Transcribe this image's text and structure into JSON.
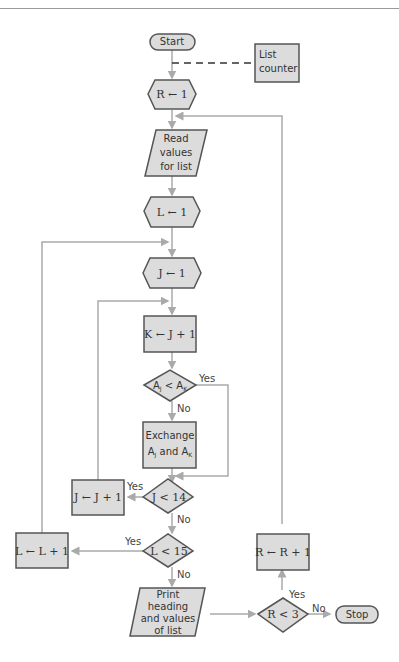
{
  "header": {
    "running_title": ""
  },
  "colors": {
    "shape_fill": "#dcdcdc",
    "shape_stroke": "#555555",
    "line": "#aaaaaa",
    "background": "#ffffff"
  },
  "flowchart": {
    "start": "Start",
    "annotation": [
      "List",
      "counter"
    ],
    "r_init": "R ← 1",
    "read": [
      "Read",
      "values",
      "for list"
    ],
    "l_init": "L ← 1",
    "j_init": "J ← 1",
    "k_assign": "K ← J + 1",
    "compare": {
      "left": "A",
      "left_sub": "J",
      "op": " < ",
      "right": "A",
      "right_sub": "K"
    },
    "exchange": {
      "line1": "Exchange",
      "line2_a": "A",
      "line2_a_sub": "J",
      "line2_mid": " and ",
      "line2_b": "A",
      "line2_b_sub": "K"
    },
    "j_test": "J < 14",
    "j_incr": "J ← J + 1",
    "l_test": "L < 15",
    "l_incr": "L ← L + 1",
    "print": [
      "Print",
      "heading",
      "and values",
      "of list"
    ],
    "r_test": "R < 3",
    "r_incr": "R ← R + 1",
    "stop": "Stop",
    "yes": "Yes",
    "no": "No"
  }
}
